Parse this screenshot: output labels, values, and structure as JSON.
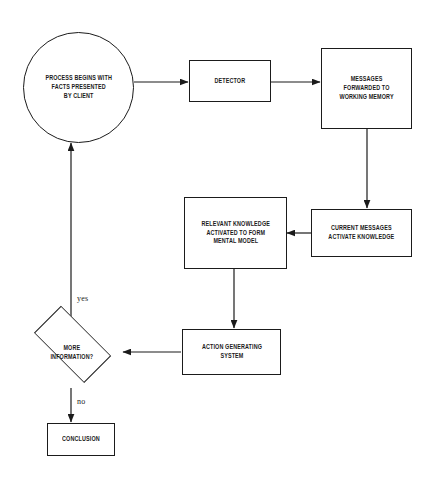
{
  "diagram": {
    "type": "flowchart",
    "background_color": "#ffffff",
    "line_color": "#1b1b1b",
    "text_color": "#1b1b1b",
    "nodes": [
      {
        "id": "start",
        "shape": "circle",
        "label": "PROCESS BEGINS WITH\nFACTS PRESENTED\nBY CLIENT"
      },
      {
        "id": "detector",
        "shape": "rectangle",
        "label": "DETECTOR"
      },
      {
        "id": "messages_forwarded",
        "shape": "rectangle",
        "label": "MESSAGES\nFORWARDED TO\nWORKING MEMORY"
      },
      {
        "id": "current_messages",
        "shape": "rectangle",
        "label": "CURRENT MESSAGES\nACTIVATE KNOWLEDGE"
      },
      {
        "id": "relevant_knowledge",
        "shape": "rectangle",
        "label": "RELEVANT KNOWLEDGE\nACTIVATED TO FORM\nMENTAL MODEL"
      },
      {
        "id": "action_generating",
        "shape": "rectangle",
        "label": "ACTION GENERATING\nSYSTEM"
      },
      {
        "id": "more_information",
        "shape": "diamond",
        "label": "MORE\nINFORMATION?"
      },
      {
        "id": "conclusion",
        "shape": "rectangle",
        "label": "CONCLUSION"
      }
    ],
    "edges": [
      {
        "id": "e1",
        "from": "start",
        "to": "detector",
        "label": ""
      },
      {
        "id": "e2",
        "from": "detector",
        "to": "messages_forwarded",
        "label": ""
      },
      {
        "id": "e3",
        "from": "messages_forwarded",
        "to": "current_messages",
        "label": ""
      },
      {
        "id": "e4",
        "from": "current_messages",
        "to": "relevant_knowledge",
        "label": ""
      },
      {
        "id": "e5",
        "from": "relevant_knowledge",
        "to": "action_generating",
        "label": ""
      },
      {
        "id": "e6",
        "from": "action_generating",
        "to": "more_information",
        "label": ""
      },
      {
        "id": "e7",
        "from": "more_information",
        "to": "start",
        "label": "yes"
      },
      {
        "id": "e8",
        "from": "more_information",
        "to": "conclusion",
        "label": "no"
      }
    ],
    "edge_labels": {
      "yes": "yes",
      "no": "no"
    }
  }
}
